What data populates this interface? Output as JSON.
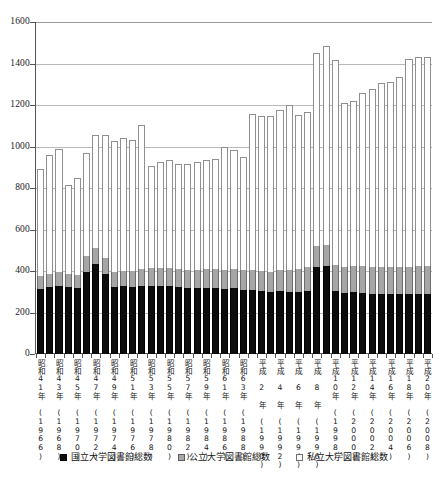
{
  "chart_data": {
    "type": "bar",
    "stacked": true,
    "title": "",
    "subtitle": "",
    "xlabel": "",
    "ylabel": "",
    "ylim": [
      0,
      1600
    ],
    "ytick_step": 200,
    "yticks": [
      0,
      200,
      400,
      600,
      800,
      1000,
      1200,
      1400,
      1600
    ],
    "grid": true,
    "legend_position": "bottom",
    "categories": [
      "昭和41年 (1966)",
      "昭和42年 (1967)",
      "昭和43年 (1968)",
      "昭和44年 (1969)",
      "昭和45年 (1970)",
      "昭和46年 (1971)",
      "昭和47年 (1972)",
      "昭和48年 (1973)",
      "昭和49年 (1974)",
      "昭和50年 (1975)",
      "昭和51年 (1976)",
      "昭和52年 (1977)",
      "昭和53年 (1978)",
      "昭和54年 (1979)",
      "昭和55年 (1980)",
      "昭和56年 (1981)",
      "昭和57年 (1982)",
      "昭和58年 (1983)",
      "昭和59年 (1984)",
      "昭和60年 (1985)",
      "昭和61年 (1986)",
      "昭和62年 (1987)",
      "昭和63年 (1988)",
      "平成元年 (1989)",
      "平成 2 年 (1990)",
      "平成 3 年 (1991)",
      "平成 4 年 (1992)",
      "平成 5 年 (1993)",
      "平成 6 年 (1994)",
      "平成 7 年 (1995)",
      "平成 8 年 (1996)",
      "平成 9 年 (1997)",
      "平成10年 (1998)",
      "平成11年 (1999)",
      "平成12年 (2000)",
      "平成13年 (2001)",
      "平成14年 (2002)",
      "平成15年 (2003)",
      "平成16年 (2004)",
      "平成17年 (2005)",
      "平成18年 (2006)",
      "平成19年 (2007)",
      "平成20年 (2008)"
    ],
    "tick_label_visible": [
      true,
      false,
      true,
      false,
      true,
      false,
      true,
      false,
      true,
      false,
      true,
      false,
      true,
      false,
      true,
      false,
      true,
      false,
      true,
      false,
      true,
      false,
      true,
      false,
      true,
      false,
      true,
      false,
      true,
      false,
      true,
      false,
      true,
      false,
      true,
      false,
      true,
      false,
      true,
      false,
      true,
      false,
      true
    ],
    "series": [
      {
        "name": "国立大学図書館総数",
        "color": "#0d0d0d",
        "values": [
          315,
          325,
          330,
          325,
          320,
          395,
          435,
          385,
          325,
          330,
          325,
          330,
          330,
          330,
          330,
          325,
          320,
          320,
          320,
          320,
          315,
          320,
          310,
          310,
          305,
          300,
          305,
          300,
          300,
          305,
          420,
          425,
          305,
          295,
          300,
          295,
          290,
          290,
          290,
          290,
          290,
          290,
          290
        ]
      },
      {
        "name": "公立大学図書館総数",
        "color": "#a6a6a6",
        "values": [
          60,
          60,
          65,
          60,
          60,
          75,
          75,
          80,
          70,
          70,
          75,
          80,
          85,
          85,
          85,
          85,
          85,
          85,
          90,
          90,
          90,
          90,
          95,
          95,
          95,
          95,
          100,
          105,
          110,
          115,
          100,
          100,
          125,
          125,
          125,
          128,
          130,
          130,
          130,
          130,
          130,
          132,
          132
        ]
      },
      {
        "name": "私立大学図書館総数",
        "color": "#ffffff",
        "values": [
          515,
          575,
          595,
          430,
          470,
          500,
          545,
          590,
          630,
          640,
          630,
          695,
          490,
          510,
          520,
          505,
          510,
          520,
          525,
          530,
          595,
          575,
          545,
          750,
          745,
          750,
          770,
          795,
          740,
          745,
          930,
          960,
          985,
          790,
          795,
          835,
          855,
          885,
          890,
          915,
          1000,
          1010,
          1010
        ]
      }
    ],
    "totals": [
      890,
      960,
      990,
      815,
      850,
      970,
      1055,
      1055,
      1025,
      1040,
      1030,
      1105,
      905,
      925,
      935,
      915,
      915,
      925,
      935,
      940,
      1000,
      985,
      950,
      1155,
      1145,
      1145,
      1175,
      1200,
      1150,
      1165,
      1450,
      1485,
      1415,
      1210,
      1220,
      1258,
      1275,
      1305,
      1310,
      1335,
      1420,
      1432,
      1432
    ]
  },
  "legend": {
    "items": [
      {
        "label": "国立大学図書館総数",
        "swatch": "national-swatch"
      },
      {
        "label": "公立大学図書館総数",
        "swatch": "public-swatch"
      },
      {
        "label": "私立大学図書館総数",
        "swatch": "private-swatch"
      }
    ]
  }
}
